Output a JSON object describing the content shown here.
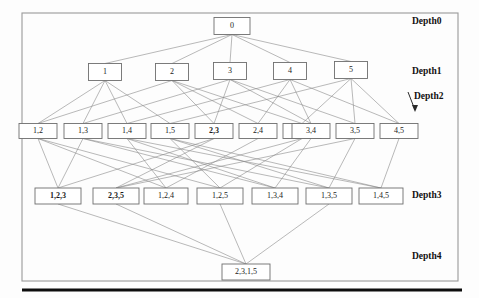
{
  "figure": {
    "kind": "lattice-diagram",
    "background_color": "#fdfdfd",
    "frame_color": "#9a9a9a",
    "edge_color": "#8a8a8a",
    "node_stroke_color": "#6e6e6e",
    "rule_color": "#0d0d0d"
  },
  "depth_labels": [
    {
      "id": "depth0",
      "text": "Depth0",
      "x": 412,
      "y": 22
    },
    {
      "id": "depth1",
      "text": "Depth1",
      "x": 412,
      "y": 72
    },
    {
      "id": "depth2",
      "text": "Depth2",
      "x": 414,
      "y": 97
    },
    {
      "id": "depth3",
      "text": "Depth3",
      "x": 412,
      "y": 196
    },
    {
      "id": "depth4",
      "text": "Depth4",
      "x": 412,
      "y": 257
    }
  ],
  "pointer": {
    "name": "depth2-arrow",
    "x1": 408,
    "y1": 92,
    "x2": 415,
    "y2": 110
  },
  "nodes": [
    {
      "id": "n0",
      "label": "0",
      "depth": 0,
      "x": 232,
      "y": 26,
      "w": 36,
      "h": 17,
      "bold": false
    },
    {
      "id": "n1",
      "label": "1",
      "depth": 1,
      "x": 105,
      "y": 72,
      "w": 33,
      "h": 17,
      "bold": false
    },
    {
      "id": "n2",
      "label": "2",
      "depth": 1,
      "x": 172,
      "y": 72,
      "w": 33,
      "h": 17,
      "bold": false
    },
    {
      "id": "n3",
      "label": "3",
      "depth": 1,
      "x": 230,
      "y": 71,
      "w": 33,
      "h": 17,
      "bold": false
    },
    {
      "id": "n4",
      "label": "4",
      "depth": 1,
      "x": 290,
      "y": 71,
      "w": 33,
      "h": 17,
      "bold": false
    },
    {
      "id": "n5",
      "label": "5",
      "depth": 1,
      "x": 351,
      "y": 70,
      "w": 33,
      "h": 17,
      "bold": false
    },
    {
      "id": "n12",
      "label": "1,2",
      "depth": 2,
      "x": 38,
      "y": 131,
      "w": 38,
      "h": 15,
      "bold": false
    },
    {
      "id": "n13",
      "label": "1,3",
      "depth": 2,
      "x": 83,
      "y": 131,
      "w": 38,
      "h": 15,
      "bold": false
    },
    {
      "id": "n14",
      "label": "1,4",
      "depth": 2,
      "x": 127,
      "y": 131,
      "w": 38,
      "h": 15,
      "bold": false
    },
    {
      "id": "n15",
      "label": "1,5",
      "depth": 2,
      "x": 170,
      "y": 131,
      "w": 38,
      "h": 15,
      "bold": false
    },
    {
      "id": "n23",
      "label": "2,3",
      "depth": 2,
      "x": 214,
      "y": 131,
      "w": 38,
      "h": 15,
      "bold": true
    },
    {
      "id": "n24",
      "label": "2,4",
      "depth": 2,
      "x": 258,
      "y": 131,
      "w": 38,
      "h": 15,
      "bold": false
    },
    {
      "id": "n25",
      "label": "2,5",
      "depth": 2,
      "x": 302,
      "y": 131,
      "w": 38,
      "h": 15,
      "bold": false
    },
    {
      "id": "n34",
      "label": "3,4",
      "depth": 2,
      "x": 311,
      "y": 131,
      "w": 38,
      "h": 15,
      "bold": false
    },
    {
      "id": "n35",
      "label": "3,5",
      "depth": 2,
      "x": 355,
      "y": 131,
      "w": 38,
      "h": 15,
      "bold": false
    },
    {
      "id": "n45",
      "label": "4,5",
      "depth": 2,
      "x": 399,
      "y": 131,
      "w": 38,
      "h": 15,
      "bold": false
    },
    {
      "id": "n123",
      "label": "1,2,3",
      "depth": 3,
      "x": 58,
      "y": 196,
      "w": 46,
      "h": 16,
      "bold": true
    },
    {
      "id": "n235",
      "label": "2,3,5",
      "depth": 3,
      "x": 116,
      "y": 196,
      "w": 46,
      "h": 16,
      "bold": true
    },
    {
      "id": "n124",
      "label": "1,2,4",
      "depth": 3,
      "x": 166,
      "y": 196,
      "w": 44,
      "h": 16,
      "bold": false
    },
    {
      "id": "n125",
      "label": "1,2,5",
      "depth": 3,
      "x": 220,
      "y": 196,
      "w": 46,
      "h": 16,
      "bold": false
    },
    {
      "id": "n134",
      "label": "1,3,4",
      "depth": 3,
      "x": 275,
      "y": 196,
      "w": 46,
      "h": 16,
      "bold": false
    },
    {
      "id": "n135",
      "label": "1,3,5",
      "depth": 3,
      "x": 329,
      "y": 196,
      "w": 46,
      "h": 16,
      "bold": false
    },
    {
      "id": "n145",
      "label": "1,4,5",
      "depth": 3,
      "x": 381,
      "y": 196,
      "w": 44,
      "h": 16,
      "bold": false
    },
    {
      "id": "n2315",
      "label": "2,3,1,5",
      "depth": 4,
      "x": 246,
      "y": 272,
      "w": 48,
      "h": 16,
      "bold": false
    }
  ],
  "edges": [
    {
      "from": "n0",
      "to": "n1"
    },
    {
      "from": "n0",
      "to": "n2"
    },
    {
      "from": "n0",
      "to": "n3"
    },
    {
      "from": "n0",
      "to": "n4"
    },
    {
      "from": "n0",
      "to": "n5"
    },
    {
      "from": "n1",
      "to": "n12"
    },
    {
      "from": "n1",
      "to": "n13"
    },
    {
      "from": "n1",
      "to": "n14"
    },
    {
      "from": "n1",
      "to": "n15"
    },
    {
      "from": "n2",
      "to": "n12"
    },
    {
      "from": "n2",
      "to": "n23"
    },
    {
      "from": "n2",
      "to": "n24"
    },
    {
      "from": "n2",
      "to": "n25"
    },
    {
      "from": "n3",
      "to": "n13"
    },
    {
      "from": "n3",
      "to": "n23"
    },
    {
      "from": "n3",
      "to": "n34"
    },
    {
      "from": "n3",
      "to": "n35"
    },
    {
      "from": "n4",
      "to": "n14"
    },
    {
      "from": "n4",
      "to": "n24"
    },
    {
      "from": "n4",
      "to": "n34"
    },
    {
      "from": "n4",
      "to": "n45"
    },
    {
      "from": "n5",
      "to": "n15"
    },
    {
      "from": "n5",
      "to": "n25"
    },
    {
      "from": "n5",
      "to": "n35"
    },
    {
      "from": "n5",
      "to": "n45"
    },
    {
      "from": "n12",
      "to": "n123"
    },
    {
      "from": "n12",
      "to": "n124"
    },
    {
      "from": "n12",
      "to": "n125"
    },
    {
      "from": "n13",
      "to": "n123"
    },
    {
      "from": "n13",
      "to": "n134"
    },
    {
      "from": "n13",
      "to": "n135"
    },
    {
      "from": "n14",
      "to": "n124"
    },
    {
      "from": "n14",
      "to": "n134"
    },
    {
      "from": "n14",
      "to": "n145"
    },
    {
      "from": "n15",
      "to": "n125"
    },
    {
      "from": "n15",
      "to": "n135"
    },
    {
      "from": "n15",
      "to": "n145"
    },
    {
      "from": "n23",
      "to": "n123"
    },
    {
      "from": "n23",
      "to": "n235"
    },
    {
      "from": "n24",
      "to": "n124"
    },
    {
      "from": "n25",
      "to": "n125"
    },
    {
      "from": "n25",
      "to": "n235"
    },
    {
      "from": "n34",
      "to": "n134"
    },
    {
      "from": "n35",
      "to": "n135"
    },
    {
      "from": "n35",
      "to": "n235"
    },
    {
      "from": "n45",
      "to": "n145"
    },
    {
      "from": "n123",
      "to": "n2315"
    },
    {
      "from": "n235",
      "to": "n2315"
    },
    {
      "from": "n125",
      "to": "n2315"
    },
    {
      "from": "n135",
      "to": "n2315"
    }
  ],
  "frame": {
    "x": 22,
    "y": 13,
    "w": 436,
    "h": 268
  },
  "rule": {
    "x1": 22,
    "y1": 290,
    "x2": 462,
    "y2": 290
  }
}
